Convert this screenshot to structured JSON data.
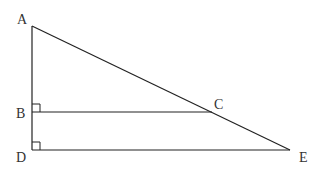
{
  "diagram": {
    "type": "geometry",
    "points": {
      "A": {
        "label": "A",
        "x": 32,
        "y": 26
      },
      "B": {
        "label": "B",
        "x": 32,
        "y": 112
      },
      "C": {
        "label": "C",
        "x": 212,
        "y": 112
      },
      "D": {
        "label": "D",
        "x": 32,
        "y": 150
      },
      "E": {
        "label": "E",
        "x": 290,
        "y": 150
      }
    },
    "segments": [
      {
        "from": "A",
        "to": "D"
      },
      {
        "from": "A",
        "to": "E"
      },
      {
        "from": "B",
        "to": "C"
      },
      {
        "from": "D",
        "to": "E"
      }
    ],
    "right_angles": [
      "B",
      "D"
    ],
    "colors": {
      "stroke": "#222222",
      "label": "#333333",
      "background": "#ffffff"
    }
  }
}
